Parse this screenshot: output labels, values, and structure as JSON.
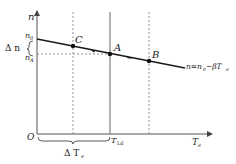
{
  "diagram": {
    "axes": {
      "y_label": "n",
      "x_label": "T",
      "x_label_sub": "e",
      "origin_label": "O"
    },
    "y_ticks": {
      "n0_main": "n",
      "n0_sub": "0",
      "nA_main": "n",
      "nA_sub": "A",
      "delta_n": "Δ n"
    },
    "x_ticks": {
      "tld_main": "T",
      "tld_sub": "Ld",
      "delta_te_main": "Δ T",
      "delta_te_sub": "e"
    },
    "points": [
      {
        "name": "C",
        "label": "C"
      },
      {
        "name": "A",
        "label": "A"
      },
      {
        "name": "B",
        "label": "B"
      }
    ],
    "equation": {
      "lhs": "n=n",
      "sub0": "0",
      "mid": "−βT",
      "sub_e": "e"
    },
    "colors": {
      "line": "#1a1a1a",
      "axis": "#555555",
      "dashed": "#777777"
    }
  }
}
